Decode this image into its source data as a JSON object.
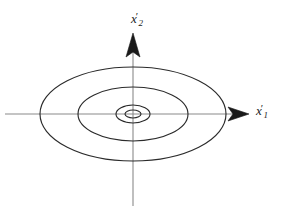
{
  "figure": {
    "name": "phase-portrait-center",
    "background_color": "#ffffff",
    "width": 287,
    "height": 220
  },
  "axes": {
    "horizontal": {
      "name": "x1-prime-axis",
      "label_base": "x",
      "label_prime": "′",
      "label_subscript": "1",
      "color": "#8a8a8a",
      "x_start": 5,
      "x_end": 247,
      "y": 114,
      "arrow": "right"
    },
    "vertical": {
      "name": "x2-prime-axis",
      "label_base": "x",
      "label_prime": "′",
      "label_subscript": "2",
      "color": "#8a8a8a",
      "y_start": 205,
      "y_end": 35,
      "x": 133,
      "arrow": "up"
    }
  },
  "chart_data": {
    "type": "line",
    "title": "",
    "xlabel": "x'_1",
    "ylabel": "x'_2",
    "grid": false,
    "legend": null,
    "center": {
      "x": 133,
      "y": 114
    },
    "xlim": [
      -93,
      93
    ],
    "ylim": [
      -47,
      47
    ],
    "series": [
      {
        "name": "orbit-1-outer",
        "rx": 93,
        "ry": 47,
        "cx": 133,
        "cy": 114,
        "color": "#2b2b2b"
      },
      {
        "name": "orbit-2",
        "rx": 55,
        "ry": 27,
        "cx": 133,
        "cy": 114,
        "color": "#2b2b2b"
      },
      {
        "name": "orbit-3",
        "rx": 17,
        "ry": 9,
        "cx": 133,
        "cy": 114,
        "color": "#2b2b2b"
      },
      {
        "name": "orbit-4-inner",
        "rx": 8,
        "ry": 4,
        "cx": 133,
        "cy": 114,
        "color": "#2b2b2b"
      }
    ]
  }
}
